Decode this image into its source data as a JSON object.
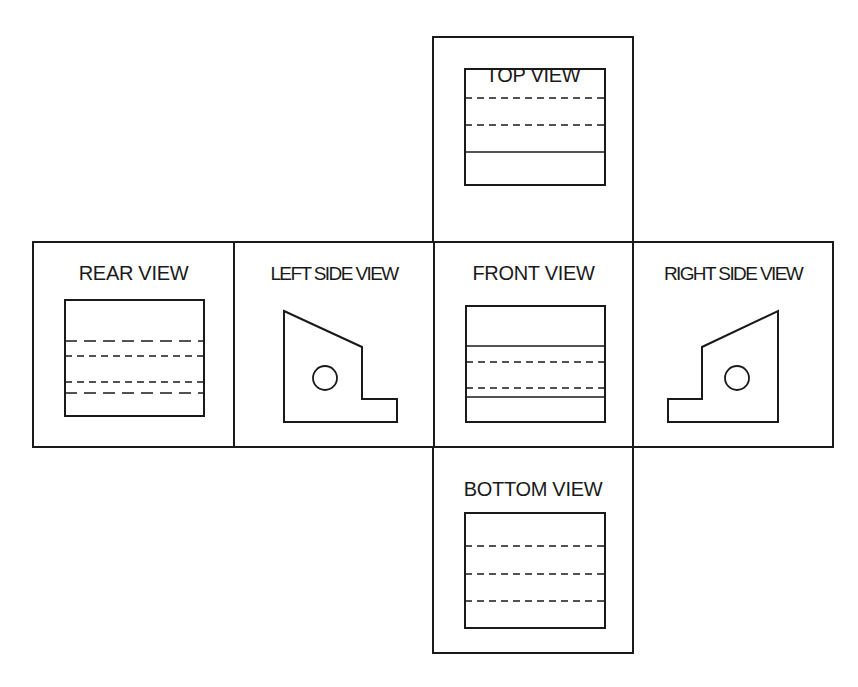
{
  "views": {
    "top": {
      "label": "TOP VIEW"
    },
    "rear": {
      "label": "REAR VIEW"
    },
    "left": {
      "label": "LEFT SIDE VIEW"
    },
    "front": {
      "label": "FRONT VIEW"
    },
    "right": {
      "label": "RIGHT SIDE VIEW"
    },
    "bottom": {
      "label": "BOTTOM VIEW"
    }
  },
  "colors": {
    "line": "#1a1a1a",
    "background": "#ffffff"
  }
}
